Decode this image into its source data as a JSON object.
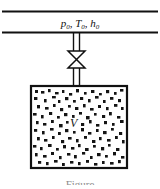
{
  "figure": {
    "type": "engineering-schematic",
    "background_color": "#ffffff",
    "line_color": "#111111",
    "supply_line": {
      "label_text": "p",
      "label_sub_1": "0",
      "label_mid_1": ", T",
      "label_sub_2": "0",
      "label_mid_2": ", h",
      "label_sub_3": "0",
      "label_plain": "p0, T0, h0"
    },
    "valve": {
      "name": "valve",
      "symbol": "bowtie"
    },
    "tank": {
      "volume_label": "V",
      "contents": "gas particles"
    },
    "caption": {
      "text": "Figure",
      "visible": "partially cut off"
    }
  }
}
